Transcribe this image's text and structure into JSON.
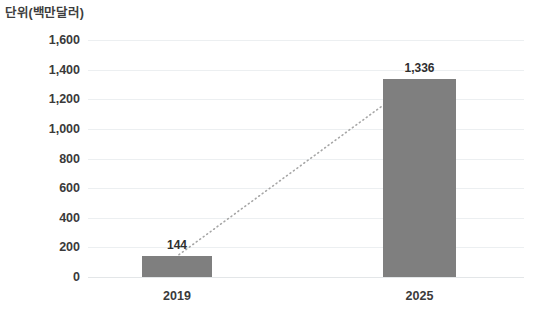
{
  "chart_data": {
    "type": "bar",
    "title": "단위(백만달러)",
    "subtitle": "",
    "xlabel": "",
    "ylabel": "",
    "categories": [
      "2019",
      "2025"
    ],
    "values": [
      144,
      1336
    ],
    "data_labels": [
      "144",
      "1,336"
    ],
    "ylim": [
      0,
      1600
    ],
    "ytick_values": [
      1600,
      1400,
      1200,
      1000,
      800,
      600,
      400,
      200,
      0
    ],
    "ytick_labels": [
      "1,600",
      "1,400",
      "1,200",
      "1,000",
      "800",
      "600",
      "400",
      "200",
      "0"
    ],
    "grid": true,
    "legend": false,
    "legend_position": "none",
    "annotations": [
      {
        "name": "growth-trend-line",
        "style": "dotted",
        "from_category": "2019",
        "from_value": 144,
        "to_category": "2025",
        "to_value": 1336
      }
    ],
    "colors": {
      "bar_fill": "#7f7f7f",
      "gridline": "#eceff1",
      "baseline": "#e3e6e8",
      "tick_label": "#3a3a3a",
      "title_text": "#3d3d3d",
      "data_label": "#2f2f2f",
      "trend_line": "#a6a6a6",
      "background": "#ffffff"
    }
  },
  "axis": {
    "y_labels": [
      "1,600",
      "1,400",
      "1,200",
      "1,000",
      "800",
      "600",
      "400",
      "200",
      "0"
    ],
    "x_labels": [
      "2019",
      "2025"
    ]
  },
  "series": {
    "bar_labels": [
      "144",
      "1,336"
    ]
  },
  "header": {
    "title": "단위(백만달러)"
  }
}
